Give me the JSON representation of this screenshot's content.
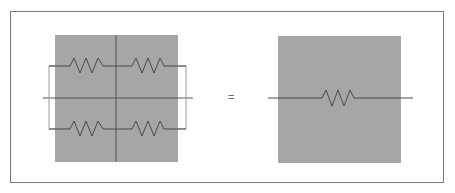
{
  "diagram": {
    "title": "",
    "equals_sign": "=",
    "left": {
      "description": "Four resistors: two series pairs connected in parallel, over a 2x2 grid of gray squares",
      "resistors": [
        {
          "id": "R-top-left"
        },
        {
          "id": "R-top-right"
        },
        {
          "id": "R-bottom-left"
        },
        {
          "id": "R-bottom-right"
        }
      ]
    },
    "right": {
      "description": "Single equivalent resistor over one gray square",
      "resistors": [
        {
          "id": "R-equivalent"
        }
      ]
    },
    "colors": {
      "box_fill": "#a6a6a6",
      "wire": "#4a4a4a",
      "grid_line": "#555555",
      "frame": "#7a7a7a",
      "bracket": "#9a9a9a"
    }
  }
}
